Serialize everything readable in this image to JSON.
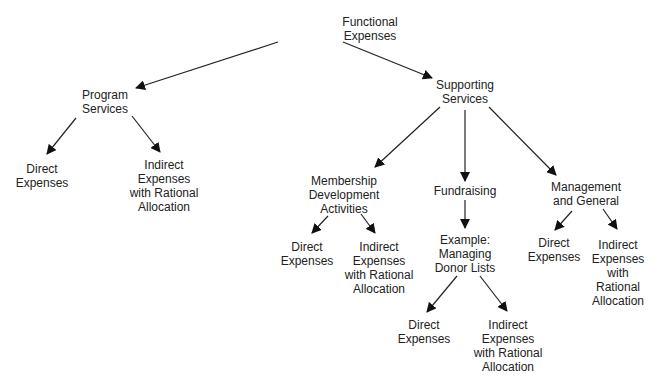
{
  "diagram": {
    "type": "tree",
    "nodes": [
      {
        "id": "root",
        "label": "Functional\nExpenses",
        "x": 370,
        "y": 15
      },
      {
        "id": "program",
        "label": "Program\nServices",
        "x": 105,
        "y": 88
      },
      {
        "id": "supporting",
        "label": "Supporting\nServices",
        "x": 465,
        "y": 78
      },
      {
        "id": "prog_direct",
        "label": "Direct\nExpenses",
        "x": 42,
        "y": 162
      },
      {
        "id": "prog_indirect",
        "label": "Indirect\nExpenses\nwith Rational\nAllocation",
        "x": 164,
        "y": 158
      },
      {
        "id": "membership",
        "label": "Membership\nDevelopment\nActivities",
        "x": 344,
        "y": 174
      },
      {
        "id": "fundraising",
        "label": "Fundraising",
        "x": 465,
        "y": 184
      },
      {
        "id": "management",
        "label": "Management\nand General",
        "x": 586,
        "y": 180
      },
      {
        "id": "mem_direct",
        "label": "Direct\nExpenses",
        "x": 307,
        "y": 240
      },
      {
        "id": "mem_indirect",
        "label": "Indirect\nExpenses\nwith Rational\nAllocation",
        "x": 379,
        "y": 240
      },
      {
        "id": "example",
        "label": "Example:\nManaging\nDonor Lists",
        "x": 465,
        "y": 233
      },
      {
        "id": "mgmt_direct",
        "label": "Direct\nExpenses",
        "x": 554,
        "y": 236
      },
      {
        "id": "mgmt_indirect",
        "label": "Indirect\nExpenses\nwith Rational\nAllocation",
        "x": 618,
        "y": 238
      },
      {
        "id": "ex_direct",
        "label": "Direct\nExpenses",
        "x": 424,
        "y": 318
      },
      {
        "id": "ex_indirect",
        "label": "Indirect\nExpenses\nwith Rational\nAllocation",
        "x": 508,
        "y": 318
      }
    ],
    "edges": [
      {
        "from": "root",
        "to": "program",
        "x1": 278,
        "y1": 42,
        "x2": 136,
        "y2": 88
      },
      {
        "from": "root",
        "to": "supporting",
        "x1": 343,
        "y1": 42,
        "x2": 432,
        "y2": 78
      },
      {
        "from": "program",
        "to": "prog_direct",
        "x1": 76,
        "y1": 118,
        "x2": 47,
        "y2": 154
      },
      {
        "from": "program",
        "to": "prog_indirect",
        "x1": 132,
        "y1": 116,
        "x2": 160,
        "y2": 152
      },
      {
        "from": "supporting",
        "to": "membership",
        "x1": 440,
        "y1": 107,
        "x2": 375,
        "y2": 167
      },
      {
        "from": "supporting",
        "to": "fundraising",
        "x1": 465,
        "y1": 110,
        "x2": 465,
        "y2": 181
      },
      {
        "from": "supporting",
        "to": "management",
        "x1": 489,
        "y1": 107,
        "x2": 556,
        "y2": 175
      },
      {
        "from": "membership",
        "to": "mem_direct",
        "x1": 328,
        "y1": 216,
        "x2": 312,
        "y2": 233
      },
      {
        "from": "membership",
        "to": "mem_indirect",
        "x1": 361,
        "y1": 214,
        "x2": 375,
        "y2": 233
      },
      {
        "from": "fundraising",
        "to": "example",
        "x1": 465,
        "y1": 200,
        "x2": 465,
        "y2": 228
      },
      {
        "from": "management",
        "to": "mgmt_direct",
        "x1": 572,
        "y1": 211,
        "x2": 555,
        "y2": 230
      },
      {
        "from": "management",
        "to": "mgmt_indirect",
        "x1": 603,
        "y1": 209,
        "x2": 617,
        "y2": 229
      },
      {
        "from": "example",
        "to": "ex_direct",
        "x1": 457,
        "y1": 276,
        "x2": 427,
        "y2": 312
      },
      {
        "from": "example",
        "to": "ex_indirect",
        "x1": 480,
        "y1": 276,
        "x2": 507,
        "y2": 311
      }
    ]
  }
}
